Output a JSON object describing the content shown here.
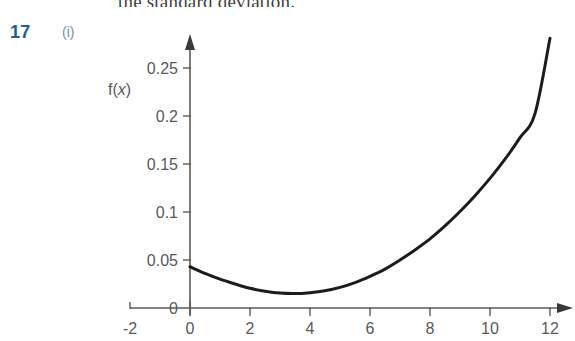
{
  "page": {
    "background_color": "#ffffff",
    "running_text": "the standard deviation."
  },
  "question": {
    "number": "17",
    "part": "(i)",
    "number_color": "#1f5e93",
    "part_color": "#6f90ab"
  },
  "chart_data": {
    "type": "line",
    "title": "",
    "xlabel": "",
    "ylabel": "f(x)",
    "ylabel_display": "f(x)",
    "xlim": [
      -2,
      12
    ],
    "ylim": [
      0,
      0.28
    ],
    "grid": false,
    "legend": null,
    "axis_color": "#5a5a5a",
    "curve_color": "#1c1c1c",
    "x_ticks": [
      "-2",
      "0",
      "2",
      "4",
      "6",
      "8",
      "10",
      "12"
    ],
    "x_tick_values": [
      -2,
      0,
      2,
      4,
      6,
      8,
      10,
      12
    ],
    "y_ticks": [
      "0",
      "0.05",
      "0.1",
      "0.15",
      "0.2",
      "0.25"
    ],
    "y_tick_values": [
      0,
      0.05,
      0.1,
      0.15,
      0.2,
      0.25
    ],
    "x_axis_arrow": true,
    "y_axis_arrow": true,
    "series": [
      {
        "name": "f(x)",
        "x": [
          0,
          0.5,
          1,
          1.5,
          2,
          2.5,
          3,
          3.5,
          4,
          4.5,
          5,
          5.5,
          6,
          6.5,
          7,
          7.5,
          8,
          8.5,
          9,
          9.5,
          10,
          10.5,
          11,
          11.5,
          12
        ],
        "y": [
          0.043,
          0.036,
          0.03,
          0.025,
          0.0205,
          0.0175,
          0.0155,
          0.015,
          0.016,
          0.018,
          0.0215,
          0.0265,
          0.033,
          0.0405,
          0.05,
          0.0605,
          0.072,
          0.0855,
          0.1005,
          0.117,
          0.135,
          0.155,
          0.1775,
          0.2025,
          0.281
        ]
      }
    ],
    "annotations": [
      {
        "text": "f(x)",
        "x_px": 118,
        "y_px": 90
      }
    ]
  }
}
